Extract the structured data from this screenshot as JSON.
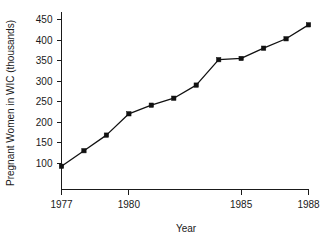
{
  "chart_data": {
    "type": "line",
    "title": "",
    "xlabel": "Year",
    "ylabel": "Pregnant Women in WIC (thousands)",
    "xlim": [
      1977,
      1988
    ],
    "ylim": [
      75,
      450
    ],
    "grid": false,
    "legend": "none",
    "x_ticks": [
      "1977",
      "1980",
      "1985",
      "1988"
    ],
    "x_tick_values": [
      1977,
      1980,
      1985,
      1988
    ],
    "y_ticks": [
      "100",
      "150",
      "200",
      "250",
      "300",
      "350",
      "400",
      "450"
    ],
    "y_tick_values": [
      100,
      150,
      200,
      250,
      300,
      350,
      400,
      450
    ],
    "x": [
      1977,
      1978,
      1979,
      1980,
      1981,
      1982,
      1983,
      1984,
      1985,
      1986,
      1987,
      1988
    ],
    "values": [
      92,
      130,
      168,
      220,
      241,
      258,
      290,
      352,
      355,
      380,
      403,
      437
    ],
    "marker": "square",
    "line_color": "#111111",
    "marker_color": "#111111",
    "background_color": "#ffffff"
  }
}
